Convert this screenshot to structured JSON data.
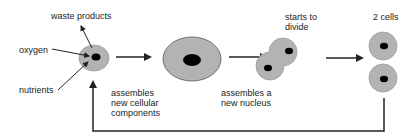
{
  "diagram": {
    "colors": {
      "cytoplasm": "#b3b3b3",
      "nucleus": "#000000",
      "line": "#222222",
      "text": "#222222"
    },
    "labels": {
      "waste_products": "waste products",
      "oxygen": "oxygen",
      "nutrients": "nutrients",
      "step1": "assembles\nnew cellular\ncomponents",
      "step2": "assembles a\nnew nucleus",
      "step3": "starts to\ndivide",
      "step4": "2 cells"
    },
    "stages": [
      {
        "name": "small-cell",
        "label": "cell taking in oxygen and nutrients"
      },
      {
        "name": "grown-cell",
        "label": "assembles new cellular components"
      },
      {
        "name": "dividing-cell",
        "label": "starts to divide"
      },
      {
        "name": "two-cells",
        "label": "2 cells"
      }
    ]
  }
}
